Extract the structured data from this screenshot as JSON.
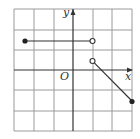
{
  "figure": {
    "type": "piecewise-function-graph",
    "axis_labels": {
      "x": "x",
      "y": "y",
      "origin": "O"
    },
    "grid": {
      "x_range": [
        -3,
        3
      ],
      "y_range": [
        -3,
        3
      ],
      "unit": 1
    },
    "pieces": [
      {
        "kind": "segment",
        "from": [
          -2.5,
          1.5
        ],
        "to": [
          1,
          1.5
        ],
        "from_endpoint": "closed",
        "to_endpoint": "open"
      },
      {
        "kind": "segment",
        "from": [
          1,
          0.5
        ],
        "to": [
          3,
          -1.5
        ],
        "from_endpoint": "open",
        "to_endpoint": "closed"
      }
    ]
  }
}
